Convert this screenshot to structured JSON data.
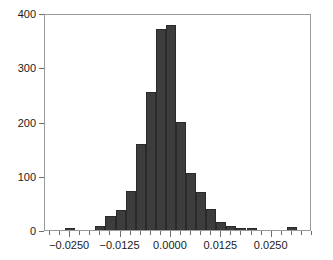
{
  "chart_data": {
    "type": "bar",
    "title": "",
    "subtitle": "",
    "xlabel": "",
    "ylabel": "",
    "grid": false,
    "legend": false,
    "legend_position": "none",
    "bar_color": "#3d3d3d",
    "bar_edge_color": "#2a2a2a",
    "frame_color": "#9a9a9a",
    "background_color": "#ffffff",
    "text_color": "#1a1a1a",
    "bin_width": 0.0025,
    "xlim": [
      -0.03125,
      0.035
    ],
    "ylim": [
      0,
      400
    ],
    "ytick_values": [
      0,
      100,
      200,
      300,
      400
    ],
    "ytick_labels": [
      "0",
      "100",
      "200",
      "300",
      "400"
    ],
    "xtick_values": [
      -0.025,
      -0.0125,
      0.0,
      0.0125,
      0.025
    ],
    "xtick_labels": [
      "-0.0250",
      "-0.0125",
      "0.0000",
      "0.0125",
      "0.0250"
    ],
    "xtick_minor_step": 0.0025,
    "bin_centers": [
      -0.03,
      -0.0275,
      -0.025,
      -0.0225,
      -0.02,
      -0.0175,
      -0.015,
      -0.0125,
      -0.01,
      -0.0075,
      -0.005,
      -0.0025,
      0.0,
      0.0025,
      0.005,
      0.0075,
      0.01,
      0.0125,
      0.015,
      0.0175,
      0.02,
      0.0225,
      0.025,
      0.0275,
      0.03,
      0.0325
    ],
    "bin_edges": [
      -0.03125,
      -0.02875,
      -0.02625,
      -0.02375,
      -0.02125,
      -0.01875,
      -0.01625,
      -0.01375,
      -0.01125,
      -0.00875,
      -0.00625,
      -0.00375,
      -0.00125,
      0.00125,
      0.00375,
      0.00625,
      0.00875,
      0.01125,
      0.01375,
      0.01625,
      0.01875,
      0.02125,
      0.02375,
      0.02625,
      0.02875,
      0.03125,
      0.03375
    ],
    "values": [
      0,
      0,
      4,
      0,
      0,
      7,
      25,
      36,
      71,
      158,
      255,
      370,
      377,
      200,
      106,
      70,
      39,
      14,
      8,
      3,
      3,
      0,
      0,
      0,
      5,
      0
    ],
    "categories": [
      "-0.030000",
      "-0.027500",
      "-0.025000",
      "-0.022500",
      "-0.020000",
      "-0.017500",
      "-0.015000",
      "-0.012500",
      "-0.010000",
      "-0.007500",
      "-0.005000",
      "-0.002500",
      "0.000000",
      "0.002500",
      "0.005000",
      "0.007500",
      "0.010000",
      "0.012500",
      "0.015000",
      "0.017500",
      "0.020000",
      "0.022500",
      "0.025000",
      "0.027500",
      "0.030000",
      "0.032500"
    ]
  }
}
